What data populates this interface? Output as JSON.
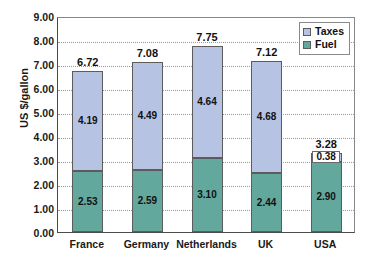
{
  "chart_data": {
    "type": "bar",
    "subtype": "stacked-column",
    "title": "",
    "subtitle": "",
    "xlabel": "",
    "ylabel": "US $/gallon",
    "ylim": [
      0,
      9
    ],
    "ytick_step": 1,
    "ytick_labels": [
      "0.00",
      "1.00",
      "2.00",
      "3.00",
      "4.00",
      "5.00",
      "6.00",
      "7.00",
      "8.00",
      "9.00"
    ],
    "ytick_values": [
      0,
      1,
      2,
      3,
      4,
      5,
      6,
      7,
      8,
      9
    ],
    "grid": true,
    "grid_axis": "y",
    "grid_style": "dotted",
    "legend_position": "top-right",
    "categories": [
      "France",
      "Germany",
      "Netherlands",
      "UK",
      "USA"
    ],
    "series": [
      {
        "name": "Fuel",
        "color": "#63a89c",
        "values": [
          2.53,
          2.59,
          3.1,
          2.44,
          2.9
        ],
        "labels": [
          "2.53",
          "2.59",
          "3.10",
          "2.44",
          "2.90"
        ]
      },
      {
        "name": "Taxes",
        "color": "#b6c3e2",
        "values": [
          4.19,
          4.49,
          4.64,
          4.68,
          0.38
        ],
        "labels": [
          "4.19",
          "4.49",
          "4.64",
          "4.68",
          "0.38"
        ]
      }
    ],
    "totals": [
      6.72,
      7.08,
      7.75,
      7.12,
      3.28
    ],
    "total_labels": [
      "6.72",
      "7.08",
      "7.75",
      "7.12",
      "3.28"
    ]
  },
  "legend": {
    "items": [
      {
        "label": "Taxes",
        "color": "#b6c3e2"
      },
      {
        "label": "Fuel",
        "color": "#63a89c"
      }
    ]
  }
}
